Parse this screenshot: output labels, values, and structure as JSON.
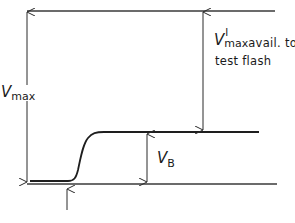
{
  "diagram": {
    "type": "voltage-level schematic",
    "lines": {
      "top_level": "V_max reference",
      "plateau_level": "baseline after rise",
      "bottom_level": "zero reference"
    },
    "labels": {
      "vmax": {
        "symbol": "V",
        "subscript": "max"
      },
      "vmax_prime": {
        "symbol": "V",
        "superscript": "I",
        "subscript": "max",
        "text_line1": "avail. to",
        "text_line2": "test flash"
      },
      "vb": {
        "symbol": "V",
        "subscript": "B"
      }
    },
    "colors": {
      "stroke": "#2a2a2a",
      "background": "#ffffff"
    }
  }
}
